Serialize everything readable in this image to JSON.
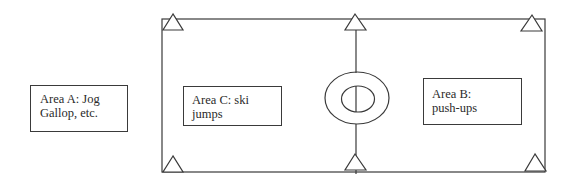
{
  "diagram": {
    "type": "field-layout",
    "colors": {
      "stroke": "#3a3a3a",
      "text": "#2a2a2a",
      "background": "#ffffff"
    },
    "areas": [
      {
        "id": "A",
        "line1": "Area A: Jog",
        "line2": "Gallop, etc."
      },
      {
        "id": "C",
        "line1": "Area C: ski",
        "line2": "jumps"
      },
      {
        "id": "B",
        "line1": "Area B:",
        "line2": "push-ups"
      }
    ],
    "markers": {
      "shape": "triangle",
      "count": 6,
      "positions": [
        "top-left",
        "top-center",
        "top-right",
        "bottom-left",
        "bottom-center",
        "bottom-right"
      ]
    },
    "center_symbol": "concentric-ellipses-with-midline"
  }
}
